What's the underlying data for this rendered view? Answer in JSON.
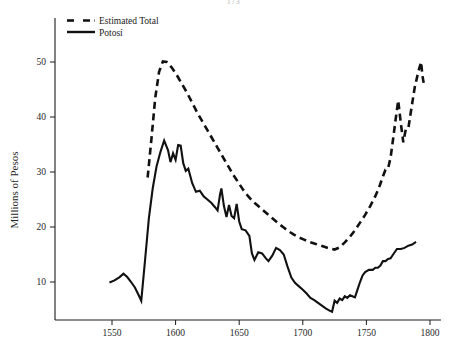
{
  "page": {
    "number": "173",
    "background_color": "#ffffff",
    "ink_color": "#111111"
  },
  "chart_data": {
    "type": "line",
    "title": "",
    "subtitle": "",
    "xlabel": "",
    "ylabel": "Millions of Pesos",
    "xlim": [
      1535,
      1812
    ],
    "ylim": [
      0,
      57
    ],
    "grid": false,
    "legend_position": "top-left",
    "xticks": [
      1550,
      1600,
      1650,
      1700,
      1750,
      1800
    ],
    "xtick_labels": [
      "1550",
      "1600",
      "1650",
      "1700",
      "1750",
      "1800"
    ],
    "yticks": [
      10,
      20,
      30,
      40,
      50
    ],
    "ytick_labels": [
      "10",
      "20",
      "30",
      "40",
      "50"
    ],
    "series": [
      {
        "name": "Estimated Total",
        "style": "dashed",
        "color": "#111111",
        "points": [
          [
            1578,
            29.0
          ],
          [
            1581,
            36.0
          ],
          [
            1584,
            43.5
          ],
          [
            1587,
            48.2
          ],
          [
            1590,
            50.1
          ],
          [
            1593,
            50.0
          ],
          [
            1597,
            49.0
          ],
          [
            1601,
            47.6
          ],
          [
            1605,
            46.0
          ],
          [
            1609,
            44.4
          ],
          [
            1613,
            42.6
          ],
          [
            1617,
            40.8
          ],
          [
            1621,
            39.2
          ],
          [
            1625,
            37.6
          ],
          [
            1629,
            36.0
          ],
          [
            1633,
            34.4
          ],
          [
            1637,
            32.8
          ],
          [
            1641,
            31.2
          ],
          [
            1645,
            29.6
          ],
          [
            1649,
            28.2
          ],
          [
            1653,
            26.8
          ],
          [
            1657,
            25.6
          ],
          [
            1661,
            24.6
          ],
          [
            1665,
            23.8
          ],
          [
            1669,
            23.0
          ],
          [
            1673,
            22.2
          ],
          [
            1677,
            21.4
          ],
          [
            1681,
            20.6
          ],
          [
            1685,
            19.9
          ],
          [
            1689,
            19.2
          ],
          [
            1693,
            18.6
          ],
          [
            1697,
            18.1
          ],
          [
            1701,
            17.7
          ],
          [
            1705,
            17.3
          ],
          [
            1709,
            17.0
          ],
          [
            1713,
            16.7
          ],
          [
            1717,
            16.4
          ],
          [
            1721,
            16.1
          ],
          [
            1725,
            15.9
          ],
          [
            1729,
            16.3
          ],
          [
            1733,
            17.2
          ],
          [
            1737,
            18.2
          ],
          [
            1741,
            19.4
          ],
          [
            1745,
            20.8
          ],
          [
            1749,
            22.2
          ],
          [
            1753,
            23.8
          ],
          [
            1757,
            25.6
          ],
          [
            1760,
            27.2
          ],
          [
            1763,
            29.2
          ],
          [
            1765,
            30.4
          ],
          [
            1767,
            30.6
          ],
          [
            1769,
            32.6
          ],
          [
            1771,
            36.0
          ],
          [
            1773,
            39.6
          ],
          [
            1775,
            43.0
          ],
          [
            1777,
            39.0
          ],
          [
            1779,
            35.4
          ],
          [
            1781,
            37.8
          ],
          [
            1783,
            38.0
          ],
          [
            1785,
            41.0
          ],
          [
            1788,
            45.4
          ],
          [
            1791,
            48.4
          ],
          [
            1793,
            50.0
          ],
          [
            1794,
            47.6
          ],
          [
            1795,
            46.2
          ]
        ]
      },
      {
        "name": "Potosí",
        "style": "solid",
        "color": "#111111",
        "points": [
          [
            1548,
            9.9
          ],
          [
            1552,
            10.3
          ],
          [
            1556,
            10.9
          ],
          [
            1559,
            11.5
          ],
          [
            1562,
            10.9
          ],
          [
            1565,
            10.0
          ],
          [
            1568,
            9.0
          ],
          [
            1571,
            7.6
          ],
          [
            1573,
            6.6
          ],
          [
            1576,
            14.0
          ],
          [
            1579,
            21.6
          ],
          [
            1582,
            27.0
          ],
          [
            1585,
            31.0
          ],
          [
            1588,
            33.6
          ],
          [
            1591,
            35.7
          ],
          [
            1594,
            34.0
          ],
          [
            1596,
            31.8
          ],
          [
            1598,
            33.4
          ],
          [
            1600,
            32.2
          ],
          [
            1602,
            34.9
          ],
          [
            1604,
            34.8
          ],
          [
            1606,
            31.6
          ],
          [
            1608,
            30.2
          ],
          [
            1610,
            30.6
          ],
          [
            1613,
            28.0
          ],
          [
            1616,
            26.4
          ],
          [
            1619,
            26.6
          ],
          [
            1622,
            25.6
          ],
          [
            1625,
            25.0
          ],
          [
            1628,
            24.4
          ],
          [
            1631,
            23.6
          ],
          [
            1633,
            23.0
          ],
          [
            1635,
            26.0
          ],
          [
            1636,
            27.0
          ],
          [
            1638,
            23.8
          ],
          [
            1640,
            21.8
          ],
          [
            1642,
            24.0
          ],
          [
            1644,
            22.0
          ],
          [
            1646,
            21.6
          ],
          [
            1648,
            24.2
          ],
          [
            1650,
            21.0
          ],
          [
            1652,
            19.6
          ],
          [
            1655,
            19.4
          ],
          [
            1658,
            18.4
          ],
          [
            1660,
            15.2
          ],
          [
            1662,
            14.0
          ],
          [
            1665,
            15.4
          ],
          [
            1668,
            15.2
          ],
          [
            1671,
            14.3
          ],
          [
            1673,
            13.8
          ],
          [
            1676,
            14.8
          ],
          [
            1679,
            16.2
          ],
          [
            1682,
            15.8
          ],
          [
            1685,
            15.0
          ],
          [
            1688,
            12.8
          ],
          [
            1691,
            10.8
          ],
          [
            1694,
            9.8
          ],
          [
            1697,
            9.2
          ],
          [
            1700,
            8.6
          ],
          [
            1703,
            7.9
          ],
          [
            1706,
            7.1
          ],
          [
            1709,
            6.7
          ],
          [
            1712,
            6.2
          ],
          [
            1715,
            5.7
          ],
          [
            1718,
            5.2
          ],
          [
            1721,
            4.8
          ],
          [
            1723,
            4.6
          ],
          [
            1725,
            6.6
          ],
          [
            1727,
            6.2
          ],
          [
            1729,
            7.0
          ],
          [
            1731,
            6.7
          ],
          [
            1733,
            7.4
          ],
          [
            1735,
            7.1
          ],
          [
            1737,
            7.6
          ],
          [
            1739,
            7.4
          ],
          [
            1741,
            7.2
          ],
          [
            1743,
            8.6
          ],
          [
            1745,
            10.0
          ],
          [
            1747,
            11.2
          ],
          [
            1749,
            11.8
          ],
          [
            1752,
            12.2
          ],
          [
            1755,
            12.2
          ],
          [
            1757,
            12.6
          ],
          [
            1759,
            12.6
          ],
          [
            1761,
            13.0
          ],
          [
            1763,
            13.8
          ],
          [
            1765,
            13.8
          ],
          [
            1767,
            14.2
          ],
          [
            1769,
            14.3
          ],
          [
            1771,
            15.0
          ],
          [
            1774,
            16.0
          ],
          [
            1777,
            16.0
          ],
          [
            1780,
            16.2
          ],
          [
            1783,
            16.6
          ],
          [
            1786,
            16.8
          ],
          [
            1789,
            17.3
          ]
        ]
      }
    ],
    "annotations": []
  },
  "legend": {
    "entries": [
      {
        "label": "Estimated Total",
        "style": "dashed"
      },
      {
        "label": "Potosí",
        "style": "solid"
      }
    ]
  }
}
